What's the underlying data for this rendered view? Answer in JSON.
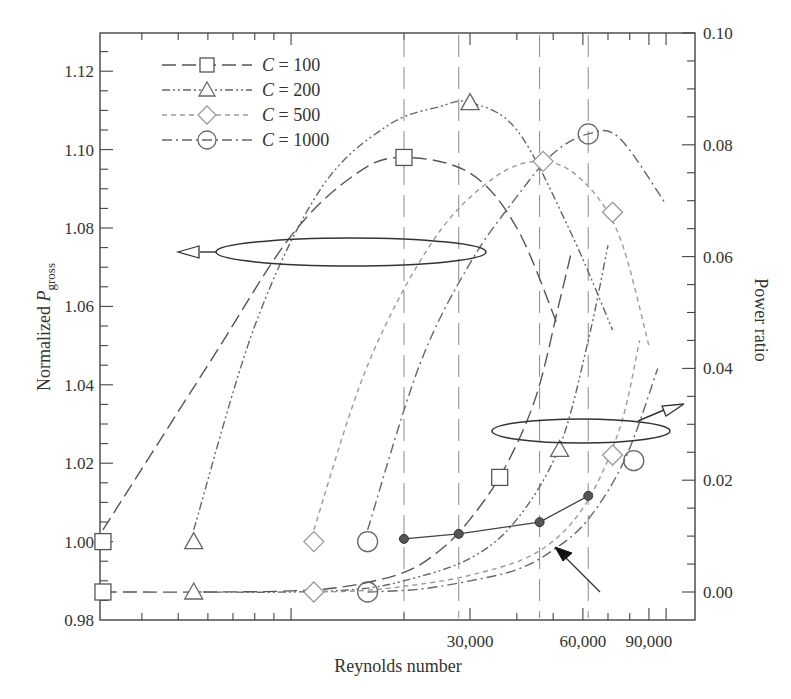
{
  "chart_data": {
    "type": "line",
    "title": "",
    "xlabel": "Reynolds number",
    "ylabel": "Normalized P_gross",
    "ylabel_main": "Normalized ",
    "ylabel_italic": "P",
    "ylabel_sub": "gross",
    "y2label": "Power ratio",
    "xscale": "log",
    "xlim": [
      3100,
      115000
    ],
    "ylim": [
      0.98,
      1.13
    ],
    "y2lim": [
      0.0,
      0.1
    ],
    "x_tick_labels": [
      {
        "value": 30000,
        "label": "30,000"
      },
      {
        "value": 60000,
        "label": "60,000"
      },
      {
        "value": 90000,
        "label": "90,000"
      }
    ],
    "y_tick_labels": [
      "0.98",
      "1.00",
      "1.02",
      "1.04",
      "1.06",
      "1.08",
      "1.10",
      "1.12"
    ],
    "y_ticks": [
      0.98,
      1.0,
      1.02,
      1.04,
      1.06,
      1.08,
      1.1,
      1.12
    ],
    "y2_tick_labels": [
      "0.00",
      "0.02",
      "0.04",
      "0.06",
      "0.08",
      "0.10"
    ],
    "y2_ticks": [
      0.0,
      0.02,
      0.04,
      0.06,
      0.08,
      0.1
    ],
    "grid": false,
    "legend_position": "upper left",
    "legend": [
      {
        "label": "C = 100",
        "c_italic": "C",
        "rest": " = 100",
        "marker": "square",
        "dash": "14,6",
        "color": "#555555"
      },
      {
        "label": "C = 200",
        "c_italic": "C",
        "rest": " = 200",
        "marker": "triangle",
        "dash": "8,3,2,3,2,3",
        "color": "#666666"
      },
      {
        "label": "C = 500",
        "c_italic": "C",
        "rest": " = 500",
        "marker": "diamond",
        "dash": "5,4",
        "color": "#9a9a9a"
      },
      {
        "label": "C = 1000",
        "c_italic": "C",
        "rest": " = 1000",
        "marker": "circle",
        "dash": "10,4,2,4",
        "color": "#666666"
      }
    ],
    "series_gross_power_left_axis": [
      {
        "name": "C = 100",
        "x": [
          3150,
          6000,
          10000,
          15000,
          20000,
          30000,
          40000,
          51000
        ],
        "y": [
          1.003,
          1.045,
          1.078,
          1.094,
          1.098,
          1.094,
          1.08,
          1.056
        ],
        "peak": {
          "x": 20000,
          "y": 1.098
        }
      },
      {
        "name": "C = 200",
        "x": [
          5500,
          8000,
          12000,
          18000,
          25000,
          30000,
          40000,
          55000,
          72000
        ],
        "y": [
          1.003,
          1.055,
          1.09,
          1.106,
          1.111,
          1.112,
          1.105,
          1.08,
          1.054
        ],
        "peak": {
          "x": 30000,
          "y": 1.112
        }
      },
      {
        "name": "C = 500",
        "x": [
          11500,
          16000,
          24000,
          35000,
          47000,
          60000,
          75000,
          90000
        ],
        "y": [
          1.003,
          1.045,
          1.077,
          1.093,
          1.097,
          1.092,
          1.078,
          1.05
        ],
        "peak": {
          "x": 47000,
          "y": 1.097
        }
      },
      {
        "name": "C = 1000",
        "x": [
          16000,
          22000,
          30000,
          40000,
          50000,
          62000,
          75000,
          100000
        ],
        "y": [
          1.003,
          1.045,
          1.071,
          1.088,
          1.099,
          1.104,
          1.103,
          1.086
        ],
        "peak": {
          "x": 62000,
          "y": 1.104
        }
      }
    ],
    "series_power_ratio_right_axis": [
      {
        "name": "C = 100",
        "x": [
          3150,
          6000,
          10000,
          14000,
          20000,
          25000,
          30000,
          37000,
          45000,
          52000,
          56000
        ],
        "y": [
          0.0,
          0.0,
          0.0002,
          0.001,
          0.0035,
          0.0075,
          0.013,
          0.022,
          0.035,
          0.052,
          0.061
        ]
      },
      {
        "name": "C = 200",
        "x": [
          5500,
          10000,
          15000,
          20000,
          30000,
          40000,
          52000,
          62000,
          70000
        ],
        "y": [
          0.0,
          0.0,
          0.0005,
          0.002,
          0.006,
          0.013,
          0.026,
          0.045,
          0.062
        ]
      },
      {
        "name": "C = 500",
        "x": [
          11500,
          15000,
          20000,
          30000,
          45000,
          60000,
          75000,
          85000
        ],
        "y": [
          0.0,
          0.0002,
          0.001,
          0.003,
          0.007,
          0.015,
          0.029,
          0.045
        ]
      },
      {
        "name": "C = 1000",
        "x": [
          16000,
          22000,
          30000,
          40000,
          50000,
          62000,
          78000,
          95000
        ],
        "y": [
          0.0,
          0.0005,
          0.002,
          0.004,
          0.0075,
          0.013,
          0.024,
          0.04
        ]
      }
    ],
    "optimum_points_power_ratio": {
      "x": [
        20000,
        28000,
        46000,
        62000
      ],
      "y": [
        0.0095,
        0.0104,
        0.0125,
        0.0172
      ]
    },
    "vertical_reference_lines_x": [
      20000,
      28000,
      46000,
      62000
    ],
    "annotations": [
      {
        "text": "",
        "type": "ellipse-with-arrow-left",
        "meaning": "upper curves refer to left axis"
      },
      {
        "text": "",
        "type": "ellipse-with-arrow-right",
        "meaning": "lower curves refer to right axis"
      },
      {
        "text": "",
        "type": "arrow",
        "meaning": "points to locus of optimum points"
      }
    ]
  }
}
